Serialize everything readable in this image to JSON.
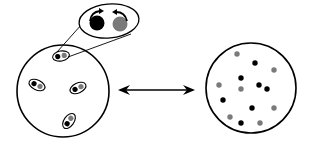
{
  "diagram": {
    "colors": {
      "stroke": "#000000",
      "dark_dot": "#000000",
      "light_dot": "#7a7a7a",
      "background": "#ffffff"
    },
    "left_circle": {
      "cx": 63,
      "cy": 91,
      "r": 46
    },
    "right_circle": {
      "cx": 251,
      "cy": 88,
      "r": 45
    },
    "pairs": [
      {
        "cx": 61,
        "cy": 56,
        "angle": -10
      },
      {
        "cx": 37,
        "cy": 85,
        "angle": 25
      },
      {
        "cx": 78,
        "cy": 88,
        "angle": -25
      },
      {
        "cx": 69,
        "cy": 121,
        "angle": -55
      }
    ],
    "callout": {
      "cx": 109,
      "cy": 21,
      "rx": 30,
      "ry": 17,
      "angle": -5,
      "dark_dot": {
        "cx": 97,
        "cy": 23,
        "r": 7.5
      },
      "light_dot": {
        "cx": 120,
        "cy": 24,
        "r": 7.5
      }
    },
    "double_arrow": {
      "x1": 120,
      "y1": 90,
      "x2": 193,
      "y2": 90
    },
    "scattered_dots": [
      {
        "cx": 237,
        "cy": 54,
        "tone": "light"
      },
      {
        "cx": 255,
        "cy": 63,
        "tone": "dark"
      },
      {
        "cx": 274,
        "cy": 70,
        "tone": "light"
      },
      {
        "cx": 241,
        "cy": 78,
        "tone": "dark"
      },
      {
        "cx": 219,
        "cy": 85,
        "tone": "light"
      },
      {
        "cx": 241,
        "cy": 89,
        "tone": "light"
      },
      {
        "cx": 259,
        "cy": 85,
        "tone": "dark"
      },
      {
        "cx": 267,
        "cy": 89,
        "tone": "dark"
      },
      {
        "cx": 223,
        "cy": 100,
        "tone": "dark"
      },
      {
        "cx": 252,
        "cy": 108,
        "tone": "dark"
      },
      {
        "cx": 274,
        "cy": 108,
        "tone": "light"
      },
      {
        "cx": 230,
        "cy": 117,
        "tone": "light"
      },
      {
        "cx": 241,
        "cy": 123,
        "tone": "dark"
      },
      {
        "cx": 260,
        "cy": 123,
        "tone": "light"
      }
    ]
  }
}
